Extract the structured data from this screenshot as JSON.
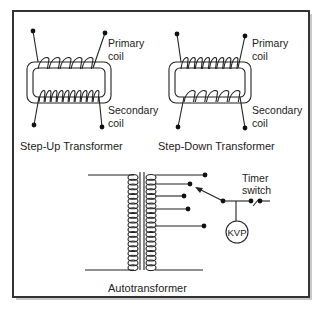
{
  "figure": {
    "panels": [
      {
        "id": "step-up",
        "caption": "Step-Up Transformer",
        "primary_label_line1": "Primary",
        "primary_label_line2": "coil",
        "secondary_label_line1": "Secondary",
        "secondary_label_line2": "coil",
        "primary_turns": 5,
        "secondary_turns": 10
      },
      {
        "id": "step-down",
        "caption": "Step-Down Transformer",
        "primary_label_line1": "Primary",
        "primary_label_line2": "coil",
        "secondary_label_line1": "Secondary",
        "secondary_label_line2": "coil",
        "primary_turns": 8,
        "secondary_turns": 5
      }
    ],
    "autotransformer": {
      "caption": "Autotransformer",
      "timer_label_line1": "Timer",
      "timer_label_line2": "switch",
      "meter_label": "KVP",
      "tap_count": 5
    },
    "colors": {
      "ink": "#222222",
      "border": "#333333",
      "shadow": "#b8b8b8",
      "background": "#ffffff"
    }
  }
}
